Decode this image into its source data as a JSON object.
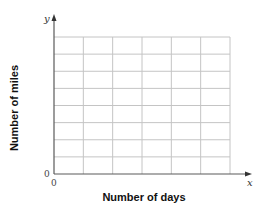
{
  "chart_data": {
    "type": "line",
    "title": "",
    "xlabel": "Number of days",
    "ylabel": "Number of miles",
    "x_axis_variable": "x",
    "y_axis_variable": "y",
    "origin_labels": {
      "x": "0",
      "y": "0"
    },
    "grid": true,
    "grid_columns": 6,
    "grid_rows": 8,
    "series": [],
    "legend": null,
    "colors": {
      "grid": "#c4c4c4",
      "axis": "#5a5a5a",
      "text": "#111111"
    }
  }
}
